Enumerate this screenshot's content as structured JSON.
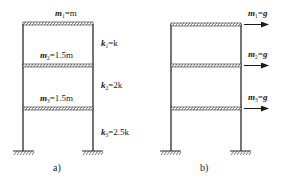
{
  "figure_a": {
    "caption": "a)",
    "masses": [
      {
        "sym": "m",
        "sub": "1",
        "value": "=m"
      },
      {
        "sym": "m",
        "sub": "2",
        "value": "=1.5m"
      },
      {
        "sym": "m",
        "sub": "3",
        "value": "=1.5m"
      }
    ],
    "stiffness": [
      {
        "sym": "k",
        "sub": "1",
        "value": "=k"
      },
      {
        "sym": "k",
        "sub": "2",
        "value": "=2k"
      },
      {
        "sym": "k",
        "sub": "3",
        "value": "=2.5k"
      }
    ]
  },
  "figure_b": {
    "caption": "b)",
    "forces": [
      {
        "sym": "m",
        "sub": "1",
        "value": "=g"
      },
      {
        "sym": "m",
        "sub": "2",
        "value": "=g"
      },
      {
        "sym": "m",
        "sub": "3",
        "value": "=g"
      }
    ]
  },
  "colors": {
    "line": "#2a2a2a",
    "hatch": "#555555"
  }
}
